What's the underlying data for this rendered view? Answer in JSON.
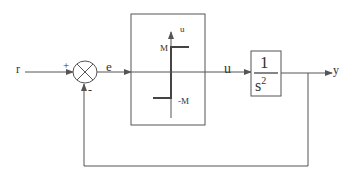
{
  "diagram": {
    "type": "closed-loop control block diagram",
    "signals": {
      "reference": "r",
      "error": "e",
      "control": "u",
      "output": "y"
    },
    "summing_junction": {
      "plus_sign": "+",
      "minus_sign": "-"
    },
    "relay_block": {
      "axis_label": "u",
      "upper_level": "M",
      "lower_level": "-M"
    },
    "plant_block": {
      "numerator": "1",
      "denominator": "s",
      "exponent": "2"
    },
    "colors": {
      "line": "#555555",
      "relay_curve": "#444444",
      "text": "#333333"
    }
  }
}
